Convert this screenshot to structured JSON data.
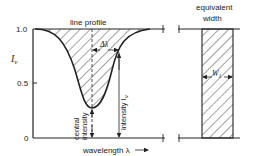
{
  "figure": {
    "axis_symbol": "I",
    "axis_symbol_sub": "ν",
    "tick_labels": [
      "1.0",
      "0.5",
      "0"
    ],
    "line_profile_label": "line profile",
    "delta_lambda_label": "Δλ",
    "intensity_label": "intensity I",
    "intensity_sub": "ν",
    "central_intensity_label_1": "central",
    "central_intensity_label_2": "intensity",
    "wavelength_label": "wavelength λ",
    "equivalent_width_label_1": "equivalent",
    "equivalent_width_label_2": "width",
    "w_label": "W",
    "w_sub": "λ"
  },
  "colors": {
    "ink": "#222222",
    "background": "#ffffff"
  }
}
